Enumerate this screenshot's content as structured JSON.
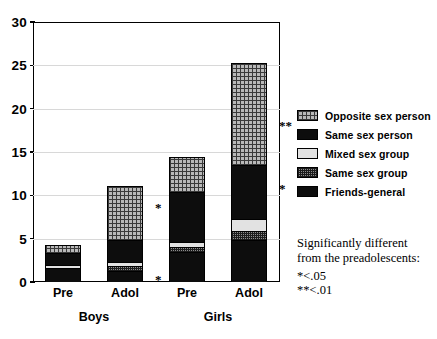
{
  "chart_data": {
    "type": "bar",
    "subtype": "stacked-bar",
    "title": "",
    "xlabel": "",
    "ylabel": "",
    "ylim": [
      0,
      30
    ],
    "yticks": [
      0,
      5,
      10,
      15,
      20,
      25,
      30
    ],
    "grid": true,
    "legend_position": "right",
    "categories": [
      "Pre",
      "Adol",
      "Pre",
      "Adol"
    ],
    "group_labels": [
      "Boys",
      "Girls"
    ],
    "series": [
      {
        "name": "Friends-general",
        "values": [
          1.6,
          1.2,
          3.4,
          4.8
        ]
      },
      {
        "name": "Same sex group",
        "values": [
          0.0,
          0.5,
          0.5,
          1.0
        ]
      },
      {
        "name": "Mixed sex group",
        "values": [
          0.3,
          0.5,
          0.6,
          1.4
        ]
      },
      {
        "name": "Same sex person",
        "values": [
          1.4,
          2.6,
          5.8,
          6.2
        ]
      },
      {
        "name": "Opposite sex person",
        "values": [
          1.0,
          6.3,
          4.1,
          11.9
        ]
      }
    ],
    "totals": [
      4.3,
      11.1,
      14.4,
      25.3
    ],
    "annotations": [
      {
        "text": "*",
        "bar": "Adol-Boys",
        "y": 8.7
      },
      {
        "text": "*",
        "bar": "Adol-Boys",
        "y": 0.3
      },
      {
        "text": "**",
        "bar": "Adol-Girls",
        "y": 18.1
      },
      {
        "text": "*",
        "bar": "Adol-Girls",
        "y": 10.8
      }
    ]
  },
  "axis": {
    "y_tick_labels": [
      "30",
      "25",
      "20",
      "15",
      "10",
      "5",
      "0"
    ]
  },
  "x_axis": {
    "ticks": [
      {
        "label": "Pre"
      },
      {
        "label": "Adol"
      },
      {
        "label": "Pre"
      },
      {
        "label": "Adol"
      }
    ],
    "groups": [
      {
        "label": "Boys"
      },
      {
        "label": "Girls"
      }
    ]
  },
  "legend": {
    "items": [
      {
        "label": "Opposite sex person",
        "pattern": "grid-gray",
        "color": "#b9b9b9"
      },
      {
        "label": "Same sex person",
        "pattern": "solid-black",
        "color": "#0d0d0d"
      },
      {
        "label": "Mixed sex group",
        "pattern": "solid-light",
        "color": "#e2e2e2"
      },
      {
        "label": "Same sex group",
        "pattern": "dotted-gray",
        "color": "#8d8d8d"
      },
      {
        "label": "Friends-general",
        "pattern": "solid-black",
        "color": "#0d0d0d"
      }
    ]
  },
  "footnote": {
    "line1": "Significantly different",
    "line2": "from the preadolescents:",
    "line3": "*<.05",
    "line4": "**<.01"
  },
  "significance_marks": {
    "adol_boys_upper": "*",
    "adol_boys_lower": "*",
    "adol_girls_upper": "**",
    "adol_girls_lower": "*"
  }
}
